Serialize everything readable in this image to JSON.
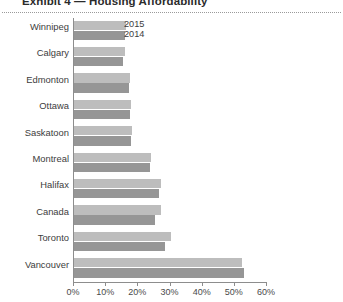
{
  "title": "Exhibit 4 — Housing Affordability",
  "legend": {
    "series_2015": "2015",
    "series_2014": "2014"
  },
  "chart_data": {
    "type": "bar",
    "orientation": "horizontal",
    "title": "Exhibit 4 — Housing Affordability",
    "xlabel": "",
    "ylabel": "",
    "xlim": [
      0,
      60
    ],
    "xticks": [
      "0%",
      "10%",
      "20%",
      "30%",
      "40%",
      "50%",
      "60%"
    ],
    "xtick_values": [
      0,
      10,
      20,
      30,
      40,
      50,
      60
    ],
    "grid": false,
    "legend_position": "inside-top-left",
    "categories": [
      "Winnipeg",
      "Calgary",
      "Edmonton",
      "Ottawa",
      "Saskatoon",
      "Montreal",
      "Halifax",
      "Canada",
      "Toronto",
      "Vancouver"
    ],
    "series": [
      {
        "name": "2015",
        "color": "#bdbdbd",
        "values": [
          16.2,
          15.7,
          17.5,
          17.8,
          18.0,
          24.0,
          27.2,
          27.2,
          30.0,
          52.3
        ]
      },
      {
        "name": "2014",
        "color": "#969696",
        "values": [
          15.8,
          15.3,
          17.2,
          17.3,
          17.6,
          23.6,
          26.3,
          25.2,
          28.4,
          52.8
        ]
      }
    ]
  }
}
